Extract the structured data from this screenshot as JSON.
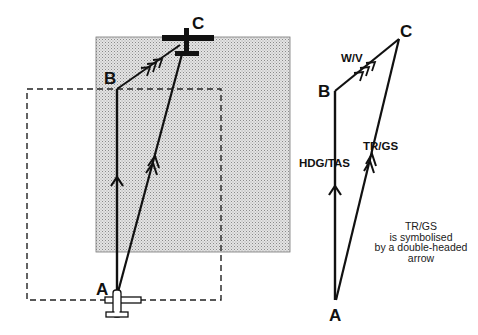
{
  "figure": {
    "left_diagram": {
      "labels": {
        "a": "A",
        "b": "B",
        "c": "C"
      },
      "elements": [
        "shaded-wind-drift-area",
        "dashed-still-air-area",
        "heading-vector-A-to-B",
        "wind-vector-B-to-C",
        "track-vector-A-to-C",
        "aircraft-at-A",
        "aircraft-at-C"
      ]
    },
    "right_diagram": {
      "labels": {
        "a": "A",
        "b": "B",
        "c": "C",
        "wind": "W/V",
        "heading": "HDG/TAS",
        "track": "TR/GS"
      }
    },
    "note": {
      "lines": [
        "TR/GS",
        "is symbolised",
        "by a double-headed",
        "arrow"
      ]
    }
  },
  "colors": {
    "ink": "#111111",
    "shade": "#cfcfcf",
    "background": "#ffffff"
  }
}
